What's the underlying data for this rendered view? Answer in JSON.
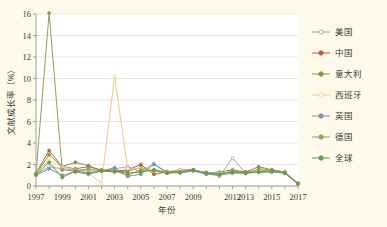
{
  "background_color": "#fdfaec",
  "panel_color": "#ffffff",
  "axes": {
    "y_label": "文献成长率（%）",
    "x_label": "年份",
    "y_ticks": [
      0,
      2,
      4,
      6,
      8,
      10,
      12,
      14,
      16
    ],
    "ylim": [
      0,
      16
    ],
    "x_tick_labels": [
      "1997",
      "1999",
      "2001",
      "2003",
      "2005",
      "2007",
      "2009",
      "2012",
      "2013",
      "2015",
      "2017"
    ],
    "grid": true
  },
  "legend": {
    "position": "right",
    "entries": [
      {
        "label": "美国",
        "color": "#a6a6a0",
        "marker": "open"
      },
      {
        "label": "中国",
        "color": "#b5623a",
        "marker": "filled"
      },
      {
        "label": "意大利",
        "color": "#8f8f3c",
        "marker": "filled"
      },
      {
        "label": "西班牙",
        "color": "#f2c986",
        "marker": "open"
      },
      {
        "label": "英国",
        "color": "#7f93a6",
        "marker": "filled"
      },
      {
        "label": "德国",
        "color": "#93a255",
        "marker": "filled"
      },
      {
        "label": "全球",
        "color": "#5f9e4a",
        "marker": "filled"
      }
    ]
  },
  "chart_data": {
    "type": "line",
    "title": "",
    "xlabel": "年份",
    "ylabel": "文献成长率（%）",
    "ylim": [
      0,
      16
    ],
    "grid": true,
    "legend_position": "right",
    "x": [
      1997,
      1998,
      1999,
      2000,
      2001,
      2002,
      2003,
      2004,
      2005,
      2006,
      2007,
      2008,
      2009,
      2010,
      2011,
      2012,
      2013,
      2014,
      2015,
      2016,
      2017
    ],
    "series": [
      {
        "name": "美国",
        "color": "#a6a6a0",
        "marker": "open",
        "values": [
          1.1,
          1.8,
          1.6,
          1.5,
          1.4,
          1.4,
          1.6,
          1.8,
          1.3,
          2.1,
          1.2,
          1.3,
          1.4,
          1.3,
          0.9,
          2.6,
          1.2,
          1.3,
          1.3,
          1.2,
          0.3
        ]
      },
      {
        "name": "中国",
        "color": "#b5623a",
        "marker": "filled",
        "values": [
          1.2,
          3.3,
          1.8,
          1.6,
          1.8,
          1.5,
          1.4,
          1.5,
          2.0,
          1.1,
          1.3,
          1.5,
          1.5,
          1.2,
          1.2,
          1.3,
          1.3,
          1.4,
          1.5,
          1.2,
          0.2
        ]
      },
      {
        "name": "意大利",
        "color": "#8f8f3c",
        "marker": "filled",
        "values": [
          1.1,
          2.9,
          1.8,
          2.2,
          1.9,
          1.4,
          1.3,
          1.4,
          1.7,
          1.4,
          1.3,
          1.4,
          1.5,
          1.2,
          1.3,
          1.5,
          1.3,
          1.8,
          1.5,
          1.3,
          0.2
        ]
      },
      {
        "name": "西班牙",
        "color": "#f2c986",
        "marker": "open",
        "values": [
          1.2,
          2.4,
          1.8,
          1.5,
          1.2,
          0.3,
          10.2,
          1.6,
          1.6,
          1.5,
          1.4,
          1.5,
          1.4,
          1.2,
          1.2,
          1.3,
          1.2,
          1.4,
          1.4,
          1.2,
          0.2
        ]
      },
      {
        "name": "英国",
        "color": "#7f93a6",
        "marker": "filled",
        "values": [
          1.0,
          1.6,
          1.0,
          1.3,
          1.1,
          1.4,
          1.7,
          0.9,
          1.1,
          2.0,
          1.3,
          1.2,
          1.4,
          1.1,
          1.0,
          1.2,
          1.2,
          1.3,
          1.3,
          1.2,
          0.2
        ]
      },
      {
        "name": "德国",
        "color": "#93a255",
        "marker": "filled",
        "values": [
          1.1,
          16.1,
          1.5,
          1.4,
          1.6,
          1.4,
          1.4,
          1.0,
          1.5,
          1.4,
          1.2,
          1.3,
          1.5,
          1.2,
          1.1,
          1.4,
          1.2,
          1.6,
          1.5,
          1.3,
          0.2
        ]
      },
      {
        "name": "全球",
        "color": "#5f9e4a",
        "marker": "filled",
        "values": [
          1.1,
          2.2,
          0.8,
          1.4,
          1.2,
          1.4,
          1.4,
          1.2,
          1.3,
          1.5,
          1.2,
          1.3,
          1.5,
          1.2,
          1.1,
          1.3,
          1.2,
          1.3,
          1.4,
          1.2,
          0.2
        ]
      }
    ]
  }
}
